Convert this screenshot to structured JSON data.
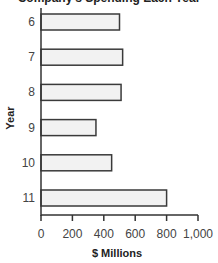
{
  "chart_data": {
    "type": "bar",
    "orientation": "horizontal",
    "title": "Company's Spending Each Year",
    "xlabel": "$ Millions",
    "ylabel": "Year",
    "categories": [
      "6",
      "7",
      "8",
      "9",
      "10",
      "11"
    ],
    "values": [
      500,
      520,
      510,
      350,
      450,
      800
    ],
    "xlim": [
      0,
      1000
    ],
    "xticks": [
      0,
      200,
      400,
      600,
      800,
      1000
    ],
    "xtick_labels": [
      "0",
      "200",
      "400",
      "600",
      "800",
      "1,000"
    ],
    "grid": false,
    "legend": null,
    "bar_fill": "#f2f2f2",
    "bar_stroke": "#3a3a3a"
  }
}
